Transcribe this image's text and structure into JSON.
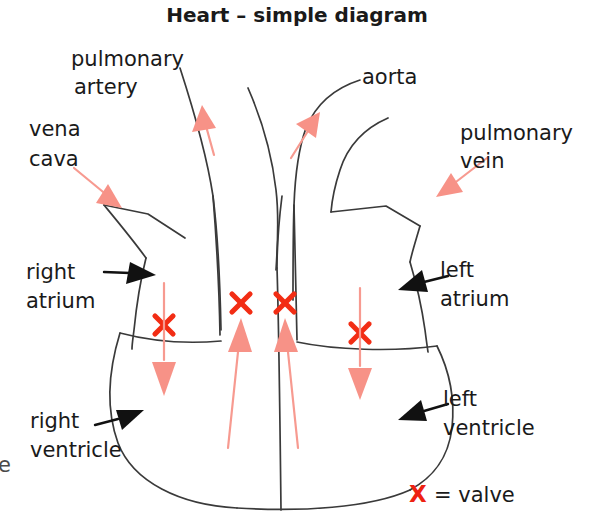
{
  "title": "Heart – simple diagram",
  "labels": {
    "pulmonary_artery_line1": "pulmonary",
    "pulmonary_artery_line2": "artery",
    "vena_cava_line1": "vena",
    "vena_cava_line2": "cava",
    "aorta": "aorta",
    "pulmonary_vein_line1": "pulmonary",
    "pulmonary_vein_line2": "vein",
    "right_atrium_line1": "right",
    "right_atrium_line2": "atrium",
    "left_atrium_line1": "left",
    "left_atrium_line2": "atrium",
    "right_ventricle_line1": "right",
    "right_ventricle_line2": "ventricle",
    "left_ventricle_line1": "left",
    "left_ventricle_line2": "ventricle",
    "edge_fragment": "e"
  },
  "legend": {
    "symbol": "X",
    "equals": "= valve"
  },
  "colors": {
    "outline": "#3a3a3a",
    "valve_red": "#f22d14",
    "flow_pink": "#f79287",
    "pointer_black": "#111111",
    "text": "#1a1a1a",
    "background": "#ffffff"
  },
  "icons": {
    "valve_marker": "red-x-icon",
    "blood_flow_arrow": "pink-arrow-icon",
    "label_pointer_arrow": "black-pointer-arrow-icon"
  },
  "structures": [
    {
      "name": "pulmonary artery",
      "type": "vessel"
    },
    {
      "name": "aorta",
      "type": "vessel"
    },
    {
      "name": "vena cava",
      "type": "vessel"
    },
    {
      "name": "pulmonary vein",
      "type": "vessel"
    },
    {
      "name": "right atrium",
      "type": "chamber"
    },
    {
      "name": "left atrium",
      "type": "chamber"
    },
    {
      "name": "right ventricle",
      "type": "chamber"
    },
    {
      "name": "left ventricle",
      "type": "chamber"
    }
  ],
  "valve_count": 4
}
